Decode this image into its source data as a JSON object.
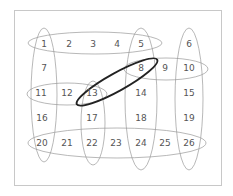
{
  "diagram": {
    "cells": [
      {
        "label": "1",
        "x": 44,
        "y": 47
      },
      {
        "label": "2",
        "x": 69,
        "y": 47
      },
      {
        "label": "3",
        "x": 93,
        "y": 47
      },
      {
        "label": "4",
        "x": 117,
        "y": 47
      },
      {
        "label": "5",
        "x": 141,
        "y": 47
      },
      {
        "label": "6",
        "x": 189,
        "y": 47
      },
      {
        "label": "7",
        "x": 44,
        "y": 71
      },
      {
        "label": "8",
        "x": 141,
        "y": 71
      },
      {
        "label": "9",
        "x": 165,
        "y": 71
      },
      {
        "label": "10",
        "x": 189,
        "y": 71
      },
      {
        "label": "11",
        "x": 41,
        "y": 96
      },
      {
        "label": "12",
        "x": 67,
        "y": 96
      },
      {
        "label": "13",
        "x": 92,
        "y": 96
      },
      {
        "label": "14",
        "x": 141,
        "y": 96
      },
      {
        "label": "15",
        "x": 189,
        "y": 96
      },
      {
        "label": "16",
        "x": 42,
        "y": 121
      },
      {
        "label": "17",
        "x": 92,
        "y": 121
      },
      {
        "label": "18",
        "x": 141,
        "y": 121
      },
      {
        "label": "19",
        "x": 189,
        "y": 121
      },
      {
        "label": "20",
        "x": 42,
        "y": 146
      },
      {
        "label": "21",
        "x": 67,
        "y": 146
      },
      {
        "label": "22",
        "x": 92,
        "y": 146
      },
      {
        "label": "23",
        "x": 116,
        "y": 146
      },
      {
        "label": "24",
        "x": 141,
        "y": 146
      },
      {
        "label": "25",
        "x": 165,
        "y": 146
      },
      {
        "label": "26",
        "x": 189,
        "y": 146
      }
    ],
    "groups": [
      {
        "name": "row-1-5",
        "members": [
          "1",
          "2",
          "3",
          "4",
          "5"
        ]
      },
      {
        "name": "col-1-20",
        "members": [
          "1",
          "7",
          "11",
          "16",
          "20"
        ]
      },
      {
        "name": "col-5-24",
        "members": [
          "5",
          "8",
          "14",
          "18",
          "24"
        ]
      },
      {
        "name": "col-6-26",
        "members": [
          "6",
          "10",
          "15",
          "19",
          "26"
        ]
      },
      {
        "name": "row-8-10",
        "members": [
          "8",
          "9",
          "10"
        ]
      },
      {
        "name": "row-11-13",
        "members": [
          "11",
          "12",
          "13"
        ]
      },
      {
        "name": "col-13-22",
        "members": [
          "13",
          "17",
          "22"
        ]
      },
      {
        "name": "row-20-26",
        "members": [
          "20",
          "21",
          "22",
          "23",
          "24",
          "25",
          "26"
        ]
      },
      {
        "name": "highlight-13-8",
        "members": [
          "13",
          "8"
        ],
        "bold": true
      }
    ]
  }
}
